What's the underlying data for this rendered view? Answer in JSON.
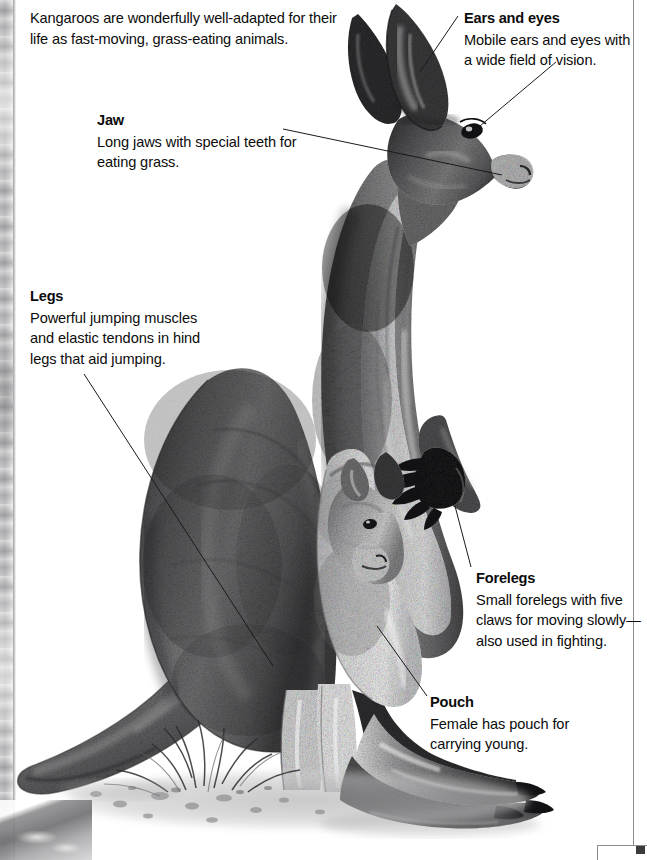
{
  "page": {
    "background_color": "#ffffff",
    "text_color": "#0c0c0c",
    "rule_color": "#8d8d8f",
    "intro": "Kangaroos are wonderfully well-adapted for their life as fast-moving, grass-eating animals."
  },
  "callouts": [
    {
      "id": "ears-and-eyes",
      "title": "Ears and eyes",
      "body": "Mobile ears and eyes with a wide field of vision."
    },
    {
      "id": "jaw",
      "title": "Jaw",
      "body": "Long jaws with special teeth for eating grass."
    },
    {
      "id": "legs",
      "title": "Legs",
      "body": "Powerful jumping muscles and elastic tendons in hind legs that aid jumping."
    },
    {
      "id": "forelegs",
      "title": "Forelegs",
      "body": "Small forelegs with five claws for moving slowly—also used in fighting."
    },
    {
      "id": "pouch",
      "title": "Pouch",
      "body": "Female has pouch for carrying young."
    }
  ],
  "illustration": {
    "subject": "red kangaroo standing in profile with joey in pouch",
    "style": "grayscale pencil and wash drawing",
    "parts": [
      "ear",
      "eye",
      "jaw",
      "neck",
      "chest",
      "foreleg-with-claws",
      "pouch",
      "joey",
      "thigh",
      "hind-foot",
      "tail",
      "ground-grass"
    ]
  }
}
